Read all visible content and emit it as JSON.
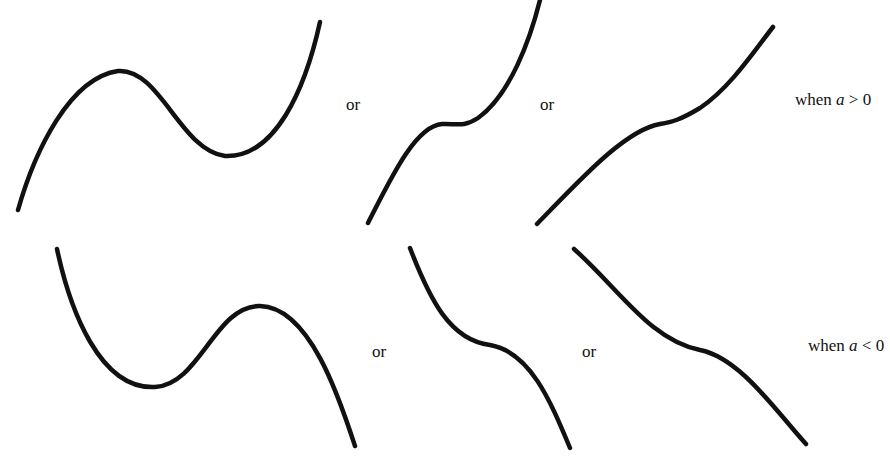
{
  "diagram": {
    "rows": [
      {
        "condition_prefix": "when",
        "condition_var": "a",
        "condition_op": " > 0",
        "separators": [
          "or",
          "or"
        ],
        "curves": [
          {
            "name": "two-turning-points-rising",
            "description": "rises to local max, falls to local min, rises"
          },
          {
            "name": "stationary-inflection-rising",
            "description": "rises with horizontal point of inflection"
          },
          {
            "name": "no-turning-points-rising",
            "description": "monotonic rising, slight inflection"
          }
        ]
      },
      {
        "condition_prefix": "when",
        "condition_var": "a",
        "condition_op": " < 0",
        "separators": [
          "or",
          "or"
        ],
        "curves": [
          {
            "name": "two-turning-points-falling",
            "description": "falls to local min, rises to local max, falls"
          },
          {
            "name": "stationary-inflection-falling",
            "description": "falls with horizontal point of inflection"
          },
          {
            "name": "no-turning-points-falling",
            "description": "monotonic falling, slight inflection"
          }
        ]
      }
    ],
    "stroke_color": "#111111",
    "background": "#ffffff"
  }
}
